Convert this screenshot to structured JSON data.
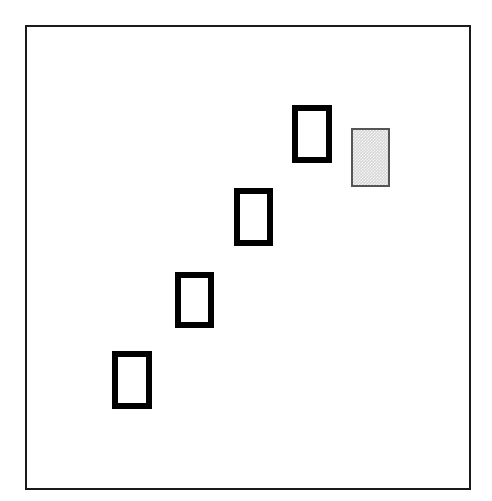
{
  "figure": {
    "title": "",
    "background_color": "#ffffff",
    "frame": {
      "name": "outer-frame",
      "x": 25,
      "y": 25,
      "width": 446,
      "height": 465,
      "border_width": 2,
      "border_color": "#1a1a1a",
      "fill": "#ffffff"
    },
    "shape_style": {
      "outline_border_color": "#000000",
      "outline_border_width": 6,
      "outline_fill": "#ffffff",
      "filled_fill_color": "#d6d6d6",
      "filled_border_color": "#555555",
      "filled_border_width": 2
    },
    "shapes": [
      {
        "id": "rect-1",
        "label": "step-1",
        "kind": "outline",
        "x": 112,
        "y": 351,
        "width": 40,
        "height": 58
      },
      {
        "id": "rect-2",
        "label": "step-2",
        "kind": "outline",
        "x": 175,
        "y": 272,
        "width": 39,
        "height": 56
      },
      {
        "id": "rect-3",
        "label": "step-3",
        "kind": "outline",
        "x": 234,
        "y": 188,
        "width": 39,
        "height": 58
      },
      {
        "id": "rect-4",
        "label": "step-4",
        "kind": "outline",
        "x": 292,
        "y": 105,
        "width": 40,
        "height": 58
      },
      {
        "id": "rect-5",
        "label": "highlighted-step",
        "kind": "filled",
        "x": 351,
        "y": 128,
        "width": 39,
        "height": 59
      }
    ]
  },
  "chart_data": {
    "type": "scatter",
    "title": "",
    "subtitle": "",
    "xlabel": "",
    "ylabel": "",
    "xlim": [
      25,
      471
    ],
    "ylim": [
      25,
      490
    ],
    "grid": false,
    "legend": "none",
    "annotations": [],
    "series": [
      {
        "name": "outline-rectangles",
        "marker": "rectangle-outline",
        "x": [
          132,
          194.5,
          253.5,
          312
        ],
        "y": [
          380,
          300,
          217,
          134
        ],
        "values": [
          {
            "cx": 132,
            "cy": 380,
            "w": 40,
            "h": 58
          },
          {
            "cx": 194.5,
            "cy": 300,
            "w": 39,
            "h": 56
          },
          {
            "cx": 253.5,
            "cy": 217,
            "w": 39,
            "h": 58
          },
          {
            "cx": 312,
            "cy": 134,
            "w": 40,
            "h": 58
          }
        ]
      },
      {
        "name": "filled-rectangle",
        "marker": "rectangle-filled",
        "x": [
          370.5
        ],
        "y": [
          157.5
        ],
        "values": [
          {
            "cx": 370.5,
            "cy": 157.5,
            "w": 39,
            "h": 59
          }
        ]
      }
    ]
  }
}
